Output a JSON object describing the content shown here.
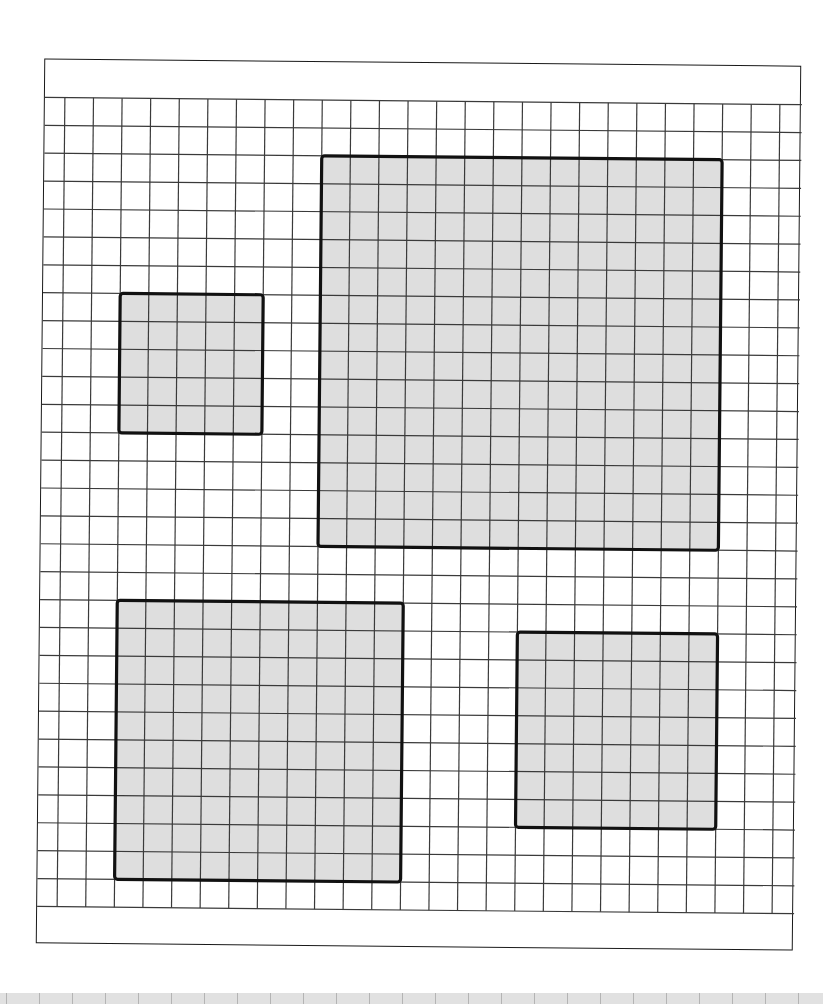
{
  "figure": {
    "sheet": {
      "width": 757,
      "height": 885,
      "rotation_deg": 0.55
    },
    "grid": {
      "origin_x": 20,
      "origin_y": 38,
      "cell_w": 28.6,
      "cell_h": 27.9,
      "cols": 25,
      "rows": 29,
      "line_color": "#3a3a3a"
    },
    "squares": [
      {
        "name": "small-square",
        "col": 2,
        "row": 7,
        "size": 5
      },
      {
        "name": "large-square",
        "col": 9,
        "row": 2,
        "size": 14
      },
      {
        "name": "bottom-left-square",
        "col": 2,
        "row": 18,
        "size": 10
      },
      {
        "name": "bottom-right-square",
        "col": 16,
        "row": 19,
        "size": 7
      }
    ],
    "colors": {
      "fill": "#dedede",
      "border": "#111111",
      "paper": "#ffffff",
      "strip": "#dcdcdc"
    }
  },
  "ruler_strip": {
    "tick_spacing": 33,
    "tick_count": 25
  }
}
